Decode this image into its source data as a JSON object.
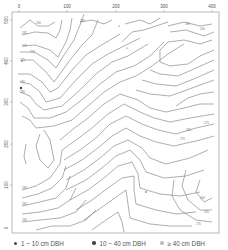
{
  "map": {
    "x_ticks": [
      "0",
      "100",
      "200",
      "300",
      "400"
    ],
    "y_ticks": [
      "500",
      "400",
      "300",
      "200",
      "100",
      "0"
    ],
    "contour_labels": [
      "260",
      "265",
      "270",
      "270",
      "275",
      "280",
      "280",
      "285",
      "290",
      "260",
      "265",
      "270",
      "275",
      "280",
      "285",
      "290",
      "260",
      "265",
      "270"
    ],
    "colors": {
      "contour": "#6a6a6a",
      "frame": "#8a8a8a",
      "small_tree": "#444444",
      "medium_tree": "#444444",
      "large_tree": "#bbbbbb"
    }
  },
  "legend": {
    "items": [
      {
        "label": "1 ~ 10 cm DBH",
        "color": "#444444"
      },
      {
        "label": "10 ~ 40 cm DBH",
        "color": "#444444"
      },
      {
        "label": "≥ 40 cm DBH",
        "color": "#bbbbbb"
      }
    ]
  }
}
